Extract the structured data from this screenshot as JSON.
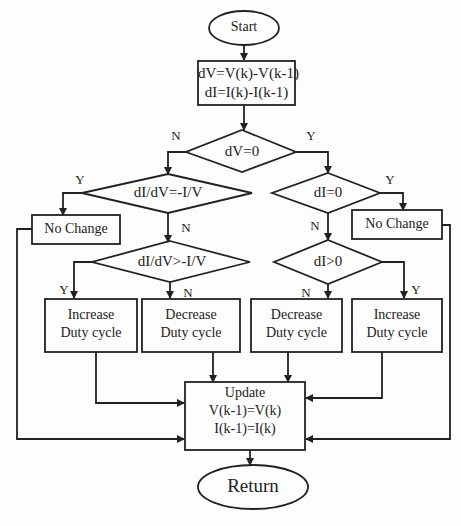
{
  "flowchart": {
    "start": "Start",
    "compute": {
      "line1": "dV=V(k)-V(k-1)",
      "line2": "dI=I(k)-I(k-1)"
    },
    "decision_dv": "dV=0",
    "decision_didv_eq": "dI/dV=-I/V",
    "decision_di_eq": "dI=0",
    "no_change_left": "No Change",
    "no_change_right": "No Change",
    "decision_didv_gt": "dI/dV>-I/V",
    "decision_di_gt": "dI>0",
    "increase_left": {
      "line1": "Increase",
      "line2": "Duty cycle"
    },
    "decrease_left": {
      "line1": "Decrease",
      "line2": "Duty cycle"
    },
    "decrease_right": {
      "line1": "Decrease",
      "line2": "Duty cycle"
    },
    "increase_right": {
      "line1": "Increase",
      "line2": "Duty cycle"
    },
    "update": {
      "line1": "Update",
      "line2": "V(k-1)=V(k)",
      "line3": "I(k-1)=I(k)"
    },
    "end": "Return",
    "branch_labels": {
      "dv_no": "N",
      "dv_yes": "Y",
      "didv_eq_yes": "Y",
      "didv_eq_no": "N",
      "di_eq_yes": "Y",
      "di_eq_no": "N",
      "didv_gt_yes": "Y",
      "didv_gt_no": "N",
      "di_gt_no": "N",
      "di_gt_yes": "Y"
    }
  }
}
